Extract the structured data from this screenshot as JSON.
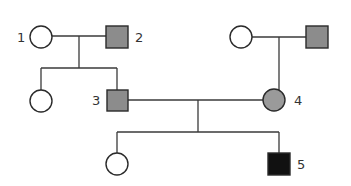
{
  "diagram": {
    "type": "pedigree",
    "colors": {
      "unaffected": "#ffffff",
      "carrier": "#8c8c8c",
      "affected": "#111111",
      "line": "#3a3a3a"
    },
    "individuals": [
      {
        "id": "1",
        "label": "1",
        "sex": "female",
        "status": "unaffected",
        "generation": 1
      },
      {
        "id": "2",
        "label": "2",
        "sex": "male",
        "status": "shaded-grey",
        "generation": 1
      },
      {
        "id": "g1-f2",
        "label": "",
        "sex": "female",
        "status": "unaffected",
        "generation": 1
      },
      {
        "id": "g1-m2",
        "label": "",
        "sex": "male",
        "status": "shaded-grey",
        "generation": 1
      },
      {
        "id": "g2-f1",
        "label": "",
        "sex": "female",
        "status": "unaffected",
        "generation": 2
      },
      {
        "id": "3",
        "label": "3",
        "sex": "male",
        "status": "shaded-grey",
        "generation": 2
      },
      {
        "id": "4",
        "label": "4",
        "sex": "female",
        "status": "shaded-grey",
        "generation": 2
      },
      {
        "id": "g3-f1",
        "label": "",
        "sex": "female",
        "status": "unaffected",
        "generation": 3
      },
      {
        "id": "5",
        "label": "5",
        "sex": "male",
        "status": "affected-black",
        "generation": 3
      }
    ],
    "relationships": [
      {
        "type": "mating",
        "partners": [
          "1",
          "2"
        ],
        "children": [
          "g2-f1",
          "3"
        ]
      },
      {
        "type": "mating",
        "partners": [
          "g1-f2",
          "g1-m2"
        ],
        "children": [
          "4"
        ]
      },
      {
        "type": "mating",
        "partners": [
          "3",
          "4"
        ],
        "children": [
          "g3-f1",
          "5"
        ]
      }
    ]
  }
}
